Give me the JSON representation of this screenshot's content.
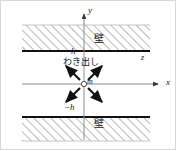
{
  "figure": {
    "width": 177,
    "height": 151,
    "background": "#ffffff",
    "border_color": "#d8d8d8"
  },
  "axes": {
    "x_label": "x",
    "y_label": "y",
    "z_label": "z",
    "axis_color": "#8c8c8c",
    "origin_x": 84,
    "origin_y": 84
  },
  "walls": {
    "label_top": "壁",
    "label_bottom": "壁",
    "line_color": "#111111",
    "hatch_color": "#9a9a9a",
    "top_wall_y": 51,
    "bottom_wall_y": 117,
    "left": 22,
    "right": 150
  },
  "markers": {
    "upper_boundary": "h",
    "lower_boundary": "−h",
    "point_label": "m",
    "source_label": "わき出し",
    "source_point_color": "#ffffff",
    "source_outline_color": "#4a4a4a"
  },
  "arrows": {
    "color": "#111111",
    "count": 4,
    "directions": [
      "up-left",
      "up-right",
      "down-left",
      "down-right"
    ]
  }
}
